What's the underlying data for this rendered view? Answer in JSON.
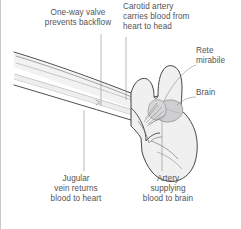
{
  "figure": {
    "colors": {
      "background": "#ffffff",
      "outline": "#3b3b3b",
      "neck_fill": "#f2f2f2",
      "head_fill": "#f0f0f0",
      "brain_fill": "#cfcfd2",
      "rete_fill": "#d6d6d9",
      "vessel_line": "#9a9a9a",
      "label_text": "#555355",
      "leader_line": "#8c8c8c",
      "edge_rule": "#c9c9c9"
    }
  },
  "labels": {
    "one_way_valve": "One-way valve\nprevents backflow",
    "carotid_artery": "Carotid artery\ncarries blood from\nheart to head",
    "rete_mirabile": "Rete\nmirabile",
    "brain": "Brain",
    "jugular_vein": "Jugular\nvein returns\nblood to heart",
    "artery_to_brain": "Artery\nsupplying\nblood to brain"
  },
  "anatomy": {
    "parts": [
      "neck",
      "head",
      "jaw",
      "brain",
      "rete-mirabile",
      "carotid-artery",
      "jugular-vein",
      "one-way-valve"
    ]
  }
}
